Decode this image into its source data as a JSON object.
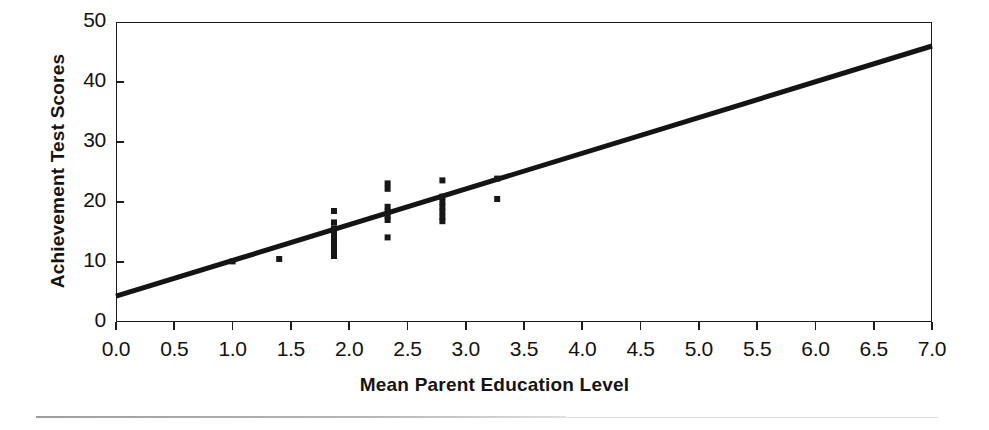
{
  "figure": {
    "kind": "scatter-with-regression-line",
    "background_color": "#ffffff",
    "mark_color": "#171717",
    "axis_color": "#1c1c1c"
  },
  "chart_data": {
    "type": "scatter",
    "title": "",
    "xlabel": "Mean Parent Education Level",
    "ylabel": "Achievement Test Scores",
    "xlim": [
      0.0,
      7.0
    ],
    "ylim": [
      0,
      50
    ],
    "xticks": [
      "0.0",
      "0.5",
      "1.0",
      "1.5",
      "2.0",
      "2.5",
      "3.0",
      "3.5",
      "4.0",
      "4.5",
      "5.0",
      "5.5",
      "6.0",
      "6.5",
      "7.0"
    ],
    "xtick_values": [
      0.0,
      0.5,
      1.0,
      1.5,
      2.0,
      2.5,
      3.0,
      3.5,
      4.0,
      4.5,
      5.0,
      5.5,
      6.0,
      6.5,
      7.0
    ],
    "yticks": [
      "0",
      "10",
      "20",
      "30",
      "40",
      "50"
    ],
    "ytick_values": [
      0,
      10,
      20,
      30,
      40,
      50
    ],
    "grid": false,
    "legend": false,
    "legend_position": "none",
    "points": [
      {
        "x": 1.0,
        "y": 10.1
      },
      {
        "x": 1.4,
        "y": 10.5
      },
      {
        "x": 1.87,
        "y": 18.5
      },
      {
        "x": 1.87,
        "y": 16.6
      },
      {
        "x": 1.87,
        "y": 15.6
      },
      {
        "x": 1.87,
        "y": 14.8
      },
      {
        "x": 1.87,
        "y": 14.0
      },
      {
        "x": 1.87,
        "y": 13.2
      },
      {
        "x": 1.87,
        "y": 12.4
      },
      {
        "x": 1.87,
        "y": 11.6
      },
      {
        "x": 1.87,
        "y": 11.0
      },
      {
        "x": 2.33,
        "y": 23.1
      },
      {
        "x": 2.33,
        "y": 22.2
      },
      {
        "x": 2.33,
        "y": 19.2
      },
      {
        "x": 2.33,
        "y": 18.4
      },
      {
        "x": 2.33,
        "y": 17.7
      },
      {
        "x": 2.33,
        "y": 17.0
      },
      {
        "x": 2.33,
        "y": 14.1
      },
      {
        "x": 2.8,
        "y": 23.6
      },
      {
        "x": 2.8,
        "y": 20.9
      },
      {
        "x": 2.8,
        "y": 20.0
      },
      {
        "x": 2.8,
        "y": 19.2
      },
      {
        "x": 2.8,
        "y": 18.4
      },
      {
        "x": 2.8,
        "y": 17.5
      },
      {
        "x": 2.8,
        "y": 16.8
      },
      {
        "x": 3.27,
        "y": 23.9
      },
      {
        "x": 3.27,
        "y": 20.5
      }
    ],
    "regression_line": {
      "x_start": 0.0,
      "y_start": 4.3,
      "x_end": 7.0,
      "y_end": 46.0,
      "slope": 5.96,
      "intercept": 4.3,
      "color": "#141414",
      "width_px": 5
    }
  }
}
